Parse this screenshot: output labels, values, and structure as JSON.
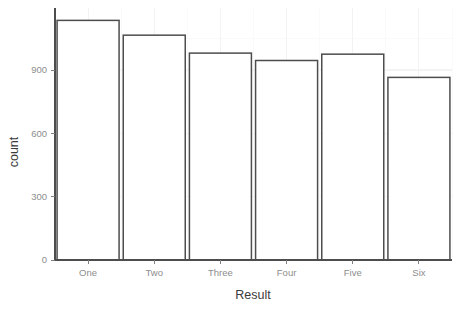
{
  "chart_data": {
    "type": "bar",
    "title": "",
    "subtitle": "",
    "xlabel": "Result",
    "ylabel": "count",
    "categories": [
      "One",
      "Two",
      "Three",
      "Four",
      "Five",
      "Six"
    ],
    "values": [
      1135,
      1065,
      980,
      945,
      975,
      865
    ],
    "series": [
      {
        "name": "count",
        "values": [
          1135,
          1065,
          980,
          945,
          975,
          865
        ]
      }
    ],
    "ylim": [
      0,
      1200
    ],
    "xlim_categories": 6,
    "y_ticks": [
      0,
      300,
      600,
      900
    ],
    "y_tick_labels": [
      "0",
      "300",
      "600",
      "900"
    ],
    "x_tick_labels": [
      "One",
      "Two",
      "Three",
      "Four",
      "Five",
      "Six"
    ],
    "grid": true,
    "grid_axis": "both",
    "legend": false,
    "legend_position": "none",
    "bar_fill_color": "#ffffff",
    "bar_stroke_color": "#4d4d4d",
    "background_color": "#ffffff",
    "gridline_color": "#f3f3f3",
    "tick_label_color": "#8d8d8d",
    "axis_title_color": "#3a3a3a",
    "annotations": []
  },
  "geometry": {
    "plot_left": 55,
    "plot_right": 452,
    "plot_top": 8,
    "baseline_y": 260,
    "y_at_900": 70,
    "bar_slot_width": 66.2,
    "bar_width": 62,
    "tick_len": 4
  },
  "labels": {
    "y_title": "count",
    "x_title": "Result"
  }
}
